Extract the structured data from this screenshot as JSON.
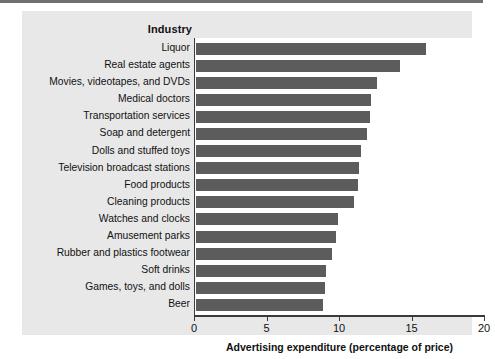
{
  "figure": {
    "category_header": "Industry",
    "background_color": "#e8e8e8",
    "plot_background_color": "#ffffff",
    "bar_color": "#5c5c5c",
    "axis_color": "#3a3a3a"
  },
  "chart_data": {
    "type": "bar",
    "orientation": "horizontal",
    "title": "",
    "subtitle": "",
    "xlabel": "Advertising expenditure (percentage of price)",
    "ylabel": "Industry",
    "xlim": [
      0,
      20
    ],
    "xticks": [
      0,
      5,
      10,
      15,
      20
    ],
    "xticklabels": [
      "0",
      "5",
      "10",
      "15",
      "20"
    ],
    "grid": false,
    "legend": null,
    "categories": [
      "Liquor",
      "Real estate agents",
      "Movies, videotapes, and DVDs",
      "Medical doctors",
      "Transportation services",
      "Soap and detergent",
      "Dolls and stuffed toys",
      "Television broadcast stations",
      "Food products",
      "Cleaning products",
      "Watches and clocks",
      "Amusement parks",
      "Rubber and plastics footwear",
      "Soft drinks",
      "Games, toys, and dolls",
      "Beer"
    ],
    "values": [
      15.9,
      14.1,
      12.5,
      12.1,
      12.0,
      11.8,
      11.4,
      11.3,
      11.2,
      10.9,
      9.8,
      9.7,
      9.4,
      9.0,
      8.9,
      8.8
    ],
    "units": "percentage of price"
  }
}
